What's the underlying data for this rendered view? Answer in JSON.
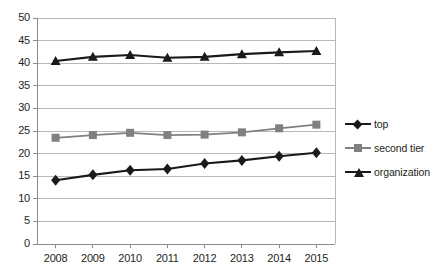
{
  "chart_data": {
    "type": "line",
    "title": "",
    "subtitle": "",
    "xlabel": "",
    "ylabel": "",
    "categories": [
      "2008",
      "2009",
      "2010",
      "2011",
      "2012",
      "2013",
      "2014",
      "2015"
    ],
    "ylim": [
      0,
      50
    ],
    "ytick_step": 5,
    "yticks": [
      "0",
      "5",
      "10",
      "15",
      "20",
      "25",
      "30",
      "35",
      "40",
      "45",
      "50"
    ],
    "grid": "horizontal",
    "legend_position": "right",
    "series": [
      {
        "name": "top",
        "marker": "diamond",
        "color": "#1a1a1a",
        "values": [
          14.1,
          15.3,
          16.3,
          16.6,
          17.8,
          18.5,
          19.4,
          20.2
        ]
      },
      {
        "name": "second tier",
        "marker": "square",
        "color": "#808080",
        "values": [
          23.5,
          24.1,
          24.6,
          24.1,
          24.2,
          24.7,
          25.6,
          26.4
        ]
      },
      {
        "name": "organization",
        "marker": "triangle",
        "color": "#1a1a1a",
        "values": [
          40.5,
          41.4,
          41.8,
          41.2,
          41.4,
          42.0,
          42.4,
          42.7
        ]
      }
    ]
  },
  "legend": {
    "items": [
      {
        "label": "top"
      },
      {
        "label": "second tier"
      },
      {
        "label": "organization"
      }
    ]
  },
  "colors": {
    "series_primary": "#1a1a1a",
    "series_secondary": "#808080",
    "grid": "#b8b8b8",
    "axis": "#8c8c8c",
    "text": "#231f20",
    "background": "#ffffff"
  }
}
